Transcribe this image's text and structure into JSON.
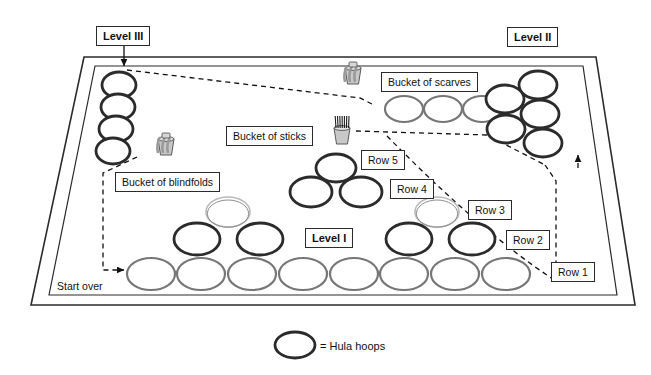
{
  "diagram": {
    "title_labels": [
      {
        "name": "level-3-label",
        "text": "Level III",
        "x": 96,
        "y": 26,
        "bold": true
      },
      {
        "name": "level-2-label",
        "text": "Level II",
        "x": 507,
        "y": 27,
        "bold": true
      },
      {
        "name": "level-1-label",
        "text": "Level I",
        "x": 305,
        "y": 228,
        "bold": true
      }
    ],
    "item_labels": [
      {
        "name": "bucket-of-scarves-label",
        "text": "Bucket of scarves",
        "x": 381,
        "y": 72
      },
      {
        "name": "bucket-of-sticks-label",
        "text": "Bucket of sticks",
        "x": 226,
        "y": 126
      },
      {
        "name": "bucket-of-blindfolds-label",
        "text": "Bucket of blindfolds",
        "x": 115,
        "y": 172
      }
    ],
    "row_labels": [
      {
        "name": "row-5-label",
        "text": "Row 5",
        "x": 361,
        "y": 150
      },
      {
        "name": "row-4-label",
        "text": "Row 4",
        "x": 390,
        "y": 179
      },
      {
        "name": "row-3-label",
        "text": "Row 3",
        "x": 468,
        "y": 200
      },
      {
        "name": "row-2-label",
        "text": "Row 2",
        "x": 506,
        "y": 230
      },
      {
        "name": "row-1-label",
        "text": "Row 1",
        "x": 551,
        "y": 262
      }
    ],
    "annotations": [
      {
        "name": "start-over-label",
        "text": "Start over",
        "x": 57,
        "y": 280
      }
    ],
    "legend": {
      "name": "legend",
      "symbol_name": "hula-hoop-symbol",
      "text": "= Hula hoops",
      "hoop": {
        "cx": 295,
        "cy": 345,
        "rx": 20,
        "ry": 13
      },
      "text_x": 320,
      "text_y": 340
    },
    "colors": {
      "dark_hoop": "#2b2b2b",
      "gray_hoop": "#767676",
      "light_hoop": "#b9b9b9",
      "outline": "#2b2b2b",
      "dashed_path": "#111111",
      "bucket_body": "#c8c8c8",
      "bucket_edge": "#5a5a5a"
    },
    "hoops": [
      {
        "name": "hoop-level3-1",
        "cx": 119,
        "cy": 85,
        "rx": 17,
        "ry": 13,
        "style": "dark"
      },
      {
        "name": "hoop-level3-2",
        "cx": 118,
        "cy": 107,
        "rx": 17,
        "ry": 13,
        "style": "dark"
      },
      {
        "name": "hoop-level3-3",
        "cx": 116,
        "cy": 129,
        "rx": 17,
        "ry": 13,
        "style": "dark"
      },
      {
        "name": "hoop-level3-4",
        "cx": 113,
        "cy": 151,
        "rx": 17,
        "ry": 13,
        "style": "dark"
      },
      {
        "name": "hoop-scarves-row-1",
        "cx": 404,
        "cy": 109,
        "rx": 19,
        "ry": 13,
        "style": "gray"
      },
      {
        "name": "hoop-scarves-row-2",
        "cx": 443,
        "cy": 109,
        "rx": 19,
        "ry": 13,
        "style": "gray"
      },
      {
        "name": "hoop-scarves-row-3",
        "cx": 482,
        "cy": 109,
        "rx": 19,
        "ry": 13,
        "style": "gray"
      },
      {
        "name": "hoop-level2-1",
        "cx": 538,
        "cy": 85,
        "rx": 19,
        "ry": 14,
        "style": "dark"
      },
      {
        "name": "hoop-level2-2",
        "cx": 505,
        "cy": 99,
        "rx": 19,
        "ry": 14,
        "style": "dark"
      },
      {
        "name": "hoop-level2-3",
        "cx": 540,
        "cy": 114,
        "rx": 19,
        "ry": 14,
        "style": "dark"
      },
      {
        "name": "hoop-level2-4",
        "cx": 506,
        "cy": 129,
        "rx": 19,
        "ry": 14,
        "style": "dark"
      },
      {
        "name": "hoop-level2-5",
        "cx": 543,
        "cy": 143,
        "rx": 19,
        "ry": 14,
        "style": "dark"
      },
      {
        "name": "hoop-row5-1",
        "cx": 336,
        "cy": 168,
        "rx": 20,
        "ry": 14,
        "style": "dark"
      },
      {
        "name": "hoop-row4-1",
        "cx": 311,
        "cy": 192,
        "rx": 21,
        "ry": 15,
        "style": "dark"
      },
      {
        "name": "hoop-row4-2",
        "cx": 361,
        "cy": 192,
        "rx": 21,
        "ry": 15,
        "style": "dark"
      },
      {
        "name": "hoop-row3-left",
        "cx": 228,
        "cy": 212,
        "rx": 22,
        "ry": 15,
        "style": "light"
      },
      {
        "name": "hoop-row3-right",
        "cx": 437,
        "cy": 212,
        "rx": 22,
        "ry": 15,
        "style": "light"
      },
      {
        "name": "hoop-row2-1",
        "cx": 197,
        "cy": 239,
        "rx": 23,
        "ry": 16,
        "style": "dark"
      },
      {
        "name": "hoop-row2-2",
        "cx": 260,
        "cy": 239,
        "rx": 23,
        "ry": 16,
        "style": "dark"
      },
      {
        "name": "hoop-row2-3",
        "cx": 409,
        "cy": 239,
        "rx": 23,
        "ry": 16,
        "style": "dark"
      },
      {
        "name": "hoop-row2-4",
        "cx": 472,
        "cy": 239,
        "rx": 23,
        "ry": 16,
        "style": "dark"
      },
      {
        "name": "hoop-row1-1",
        "cx": 151,
        "cy": 274,
        "rx": 24,
        "ry": 16,
        "style": "gray"
      },
      {
        "name": "hoop-row1-2",
        "cx": 201,
        "cy": 274,
        "rx": 24,
        "ry": 16,
        "style": "gray"
      },
      {
        "name": "hoop-row1-3",
        "cx": 252,
        "cy": 274,
        "rx": 24,
        "ry": 16,
        "style": "gray"
      },
      {
        "name": "hoop-row1-4",
        "cx": 303,
        "cy": 274,
        "rx": 24,
        "ry": 16,
        "style": "gray"
      },
      {
        "name": "hoop-row1-5",
        "cx": 354,
        "cy": 274,
        "rx": 24,
        "ry": 16,
        "style": "gray"
      },
      {
        "name": "hoop-row1-6",
        "cx": 404,
        "cy": 274,
        "rx": 24,
        "ry": 16,
        "style": "gray"
      },
      {
        "name": "hoop-row1-7",
        "cx": 455,
        "cy": 274,
        "rx": 24,
        "ry": 16,
        "style": "gray"
      },
      {
        "name": "hoop-row1-8",
        "cx": 506,
        "cy": 274,
        "rx": 24,
        "ry": 16,
        "style": "gray"
      }
    ],
    "buckets": [
      {
        "name": "bucket-of-scarves-icon",
        "x": 344,
        "y": 62
      },
      {
        "name": "bucket-of-sticks-icon",
        "x": 333,
        "y": 122
      },
      {
        "name": "bucket-of-blindfolds-icon",
        "x": 157,
        "y": 133
      }
    ],
    "mat": {
      "name": "gym-mat-outline",
      "outer": "31,305 84,57 596,57 635,305",
      "inner": "49,295 95,66 583,66 617,295"
    },
    "paths": [
      {
        "name": "level3-arrow",
        "d": "M 124 40 L 124 66",
        "arrow": true,
        "dashed": false
      },
      {
        "name": "dashed-route-upper",
        "d": "M 127 70 L 360 98 L 372 104",
        "dashed": true
      },
      {
        "name": "dashed-route-sticks",
        "d": "M 356 131 L 487 135 L 545 165",
        "dashed": true
      },
      {
        "name": "dashed-route-level2-down",
        "d": "M 545 165 L 556 181 L 556 281",
        "dashed": true
      },
      {
        "name": "dashed-route-arc",
        "d": "M 387 136 C 440 190 500 245 556 281",
        "dashed": true
      },
      {
        "name": "level2-up-arrow",
        "d": "M 578 168 L 578 155",
        "arrow": true,
        "dashed": true
      },
      {
        "name": "dashed-route-blindfolds",
        "d": "M 137 157 L 103 173 L 103 270 L 124 270",
        "dashed": true,
        "arrow_end": true
      }
    ]
  }
}
